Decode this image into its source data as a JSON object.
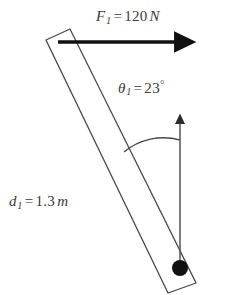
{
  "figure": {
    "type": "physics-free-body-diagram",
    "background_color": "#ffffff",
    "ink_color": "#3a3a3a",
    "width": 225,
    "height": 295
  },
  "labels": {
    "force": {
      "symbol": "F",
      "subscript": "1",
      "equals": "=",
      "value": "120",
      "unit": "N",
      "full_text": "F_1 = 120 N"
    },
    "angle": {
      "symbol": "θ",
      "subscript": "1",
      "equals": "=",
      "value": "23",
      "unit": "°",
      "full_text": "θ_1 = 23°"
    },
    "distance": {
      "symbol": "d",
      "subscript": "1",
      "equals": "=",
      "value": "1.3",
      "unit": "m",
      "full_text": "d_1 = 1.3 m"
    }
  },
  "geometry": {
    "rod": {
      "description": "thin rectangular bar tilted down-right",
      "outline_points": "46,40 70,29 196,283 168,293",
      "stroke": "#4a4a4a",
      "stroke_width": 1.3,
      "fill": "none"
    },
    "force_arrow": {
      "description": "horizontal force arrow pointing right from rod top",
      "x1": 58,
      "y1": 42,
      "x2": 186,
      "y2": 42,
      "stroke": "#111111",
      "stroke_width": 3.6,
      "head": "solid-triangle"
    },
    "vertical_arrow": {
      "description": "thin vertical reference arrow pointing up from the bob",
      "x1": 180,
      "y1": 266,
      "x2": 180,
      "y2": 118,
      "stroke": "#555555",
      "stroke_width": 1.5,
      "head": "small-solid-triangle"
    },
    "angle_arc": {
      "description": "arc between rod axis and vertical arrow",
      "path": "M 124,152 A 62,62 0 0 1 180,140",
      "stroke": "#4a4a4a",
      "stroke_width": 1.4
    },
    "bob": {
      "description": "filled circular mass at lower end of rod",
      "cx": 180,
      "cy": 268,
      "r": 8,
      "fill": "#111111"
    }
  }
}
